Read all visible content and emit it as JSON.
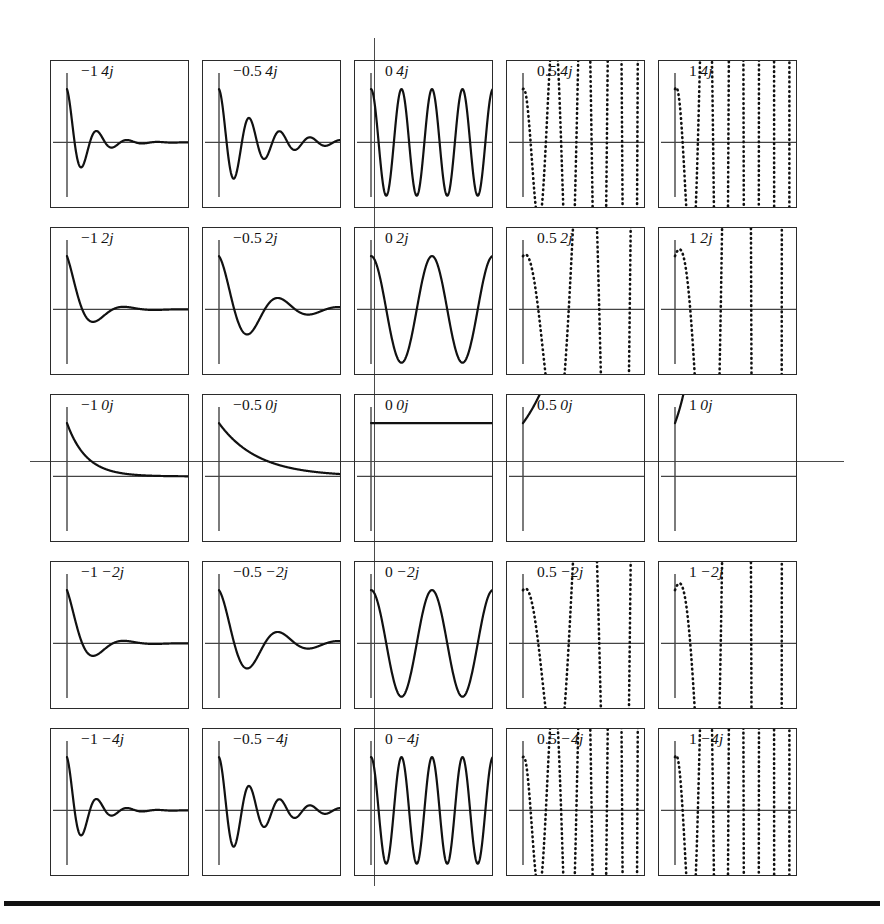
{
  "figure": {
    "name": "impulse-response-grid",
    "colors": {
      "curve": "#111111",
      "panel_border": "#2b2b2b",
      "panel_axis": "#444444",
      "plane_axis": "#4a4a4a",
      "rule": "#111111",
      "background": "#ffffff"
    },
    "plane_axes": {
      "horizontal_label": "",
      "vertical_label": "",
      "horizontal_y": 461,
      "vertical_x": 374
    },
    "bottom_rule": {
      "visible": true,
      "thickness_px": 5
    }
  },
  "chart_data": {
    "type": "line",
    "title": "",
    "subtitle": "",
    "xlabel": "",
    "ylabel": "",
    "grid": false,
    "legend": "none",
    "layout": {
      "rows": 5,
      "cols": 5
    },
    "column_values": [
      -1,
      -0.5,
      0,
      0.5,
      1
    ],
    "row_values": [
      4,
      2,
      0,
      -2,
      -4
    ],
    "column_labels": [
      "−1",
      "−0.5",
      "0",
      "0.5",
      "1"
    ],
    "row_labels": [
      "4j",
      "2j",
      "0j",
      "−2j",
      "−4j"
    ],
    "function": "h(t) = e^(sigma*t) * cos(omega*t), t >= 0",
    "t_range": [
      0,
      6.2832
    ],
    "ylim": [
      -1.25,
      1.25
    ],
    "axis_crossing_fraction": 0.55,
    "panels": [
      {
        "id": "p-0-0",
        "row": 0,
        "col": 0,
        "sigma": -1,
        "omega": 4,
        "label_real": "−1",
        "label_imag": "4j",
        "label": "−1 4j",
        "style": "solid",
        "clipped": false
      },
      {
        "id": "p-0-1",
        "row": 0,
        "col": 1,
        "sigma": -0.5,
        "omega": 4,
        "label_real": "−0.5",
        "label_imag": "4j",
        "label": "−0.5 4j",
        "style": "solid",
        "clipped": false
      },
      {
        "id": "p-0-2",
        "row": 0,
        "col": 2,
        "sigma": 0,
        "omega": 4,
        "label_real": "0",
        "label_imag": "4j",
        "label": "0 4j",
        "style": "solid",
        "clipped": false
      },
      {
        "id": "p-0-3",
        "row": 0,
        "col": 3,
        "sigma": 0.5,
        "omega": 4,
        "label_real": "0.5",
        "label_imag": "4j",
        "label": "0.5 4j",
        "style": "dotted",
        "clipped": true
      },
      {
        "id": "p-0-4",
        "row": 0,
        "col": 4,
        "sigma": 1,
        "omega": 4,
        "label_real": "1",
        "label_imag": "4j",
        "label": "1 4j",
        "style": "dotted",
        "clipped": true
      },
      {
        "id": "p-1-0",
        "row": 1,
        "col": 0,
        "sigma": -1,
        "omega": 2,
        "label_real": "−1",
        "label_imag": "2j",
        "label": "−1 2j",
        "style": "solid",
        "clipped": false
      },
      {
        "id": "p-1-1",
        "row": 1,
        "col": 1,
        "sigma": -0.5,
        "omega": 2,
        "label_real": "−0.5",
        "label_imag": "2j",
        "label": "−0.5 2j",
        "style": "solid",
        "clipped": false
      },
      {
        "id": "p-1-2",
        "row": 1,
        "col": 2,
        "sigma": 0,
        "omega": 2,
        "label_real": "0",
        "label_imag": "2j",
        "label": "0 2j",
        "style": "solid",
        "clipped": false
      },
      {
        "id": "p-1-3",
        "row": 1,
        "col": 3,
        "sigma": 0.5,
        "omega": 2,
        "label_real": "0.5",
        "label_imag": "2j",
        "label": "0.5 2j",
        "style": "dotted",
        "clipped": true
      },
      {
        "id": "p-1-4",
        "row": 1,
        "col": 4,
        "sigma": 1,
        "omega": 2,
        "label_real": "1",
        "label_imag": "2j",
        "label": "1 2j",
        "style": "dotted",
        "clipped": true
      },
      {
        "id": "p-2-0",
        "row": 2,
        "col": 0,
        "sigma": -1,
        "omega": 0,
        "label_real": "−1",
        "label_imag": "0j",
        "label": "−1 0j",
        "style": "solid",
        "clipped": false
      },
      {
        "id": "p-2-1",
        "row": 2,
        "col": 1,
        "sigma": -0.5,
        "omega": 0,
        "label_real": "−0.5",
        "label_imag": "0j",
        "label": "−0.5 0j",
        "style": "solid",
        "clipped": false
      },
      {
        "id": "p-2-2",
        "row": 2,
        "col": 2,
        "sigma": 0,
        "omega": 0,
        "label_real": "0",
        "label_imag": "0j",
        "label": "0 0j",
        "style": "solid",
        "clipped": false
      },
      {
        "id": "p-2-3",
        "row": 2,
        "col": 3,
        "sigma": 0.5,
        "omega": 0,
        "label_real": "0.5",
        "label_imag": "0j",
        "label": "0.5 0j",
        "style": "solid",
        "clipped": true
      },
      {
        "id": "p-2-4",
        "row": 2,
        "col": 4,
        "sigma": 1,
        "omega": 0,
        "label_real": "1",
        "label_imag": "0j",
        "label": "1 0j",
        "style": "solid",
        "clipped": true
      },
      {
        "id": "p-3-0",
        "row": 3,
        "col": 0,
        "sigma": -1,
        "omega": -2,
        "label_real": "−1",
        "label_imag": "−2j",
        "label": "−1 −2j",
        "style": "solid",
        "clipped": false
      },
      {
        "id": "p-3-1",
        "row": 3,
        "col": 1,
        "sigma": -0.5,
        "omega": -2,
        "label_real": "−0.5",
        "label_imag": "−2j",
        "label": "−0.5 −2j",
        "style": "solid",
        "clipped": false
      },
      {
        "id": "p-3-2",
        "row": 3,
        "col": 2,
        "sigma": 0,
        "omega": -2,
        "label_real": "0",
        "label_imag": "−2j",
        "label": "0 −2j",
        "style": "solid",
        "clipped": false
      },
      {
        "id": "p-3-3",
        "row": 3,
        "col": 3,
        "sigma": 0.5,
        "omega": -2,
        "label_real": "0.5",
        "label_imag": "−2j",
        "label": "0.5 −2j",
        "style": "dotted",
        "clipped": true
      },
      {
        "id": "p-3-4",
        "row": 3,
        "col": 4,
        "sigma": 1,
        "omega": -2,
        "label_real": "1",
        "label_imag": "−2j",
        "label": "1 −2j",
        "style": "dotted",
        "clipped": true
      },
      {
        "id": "p-4-0",
        "row": 4,
        "col": 0,
        "sigma": -1,
        "omega": -4,
        "label_real": "−1",
        "label_imag": "−4j",
        "label": "−1 −4j",
        "style": "solid",
        "clipped": false
      },
      {
        "id": "p-4-1",
        "row": 4,
        "col": 1,
        "sigma": -0.5,
        "omega": -4,
        "label_real": "−0.5",
        "label_imag": "−4j",
        "label": "−0.5 −4j",
        "style": "solid",
        "clipped": false
      },
      {
        "id": "p-4-2",
        "row": 4,
        "col": 2,
        "sigma": 0,
        "omega": -4,
        "label_real": "0",
        "label_imag": "−4j",
        "label": "0 −4j",
        "style": "solid",
        "clipped": false
      },
      {
        "id": "p-4-3",
        "row": 4,
        "col": 3,
        "sigma": 0.5,
        "omega": -4,
        "label_real": "0.5",
        "label_imag": "−4j",
        "label": "0.5 −4j",
        "style": "dotted",
        "clipped": true
      },
      {
        "id": "p-4-4",
        "row": 4,
        "col": 4,
        "sigma": 1,
        "omega": -4,
        "label_real": "1",
        "label_imag": "−4j",
        "label": "1 −4j",
        "style": "dotted",
        "clipped": true
      }
    ]
  }
}
